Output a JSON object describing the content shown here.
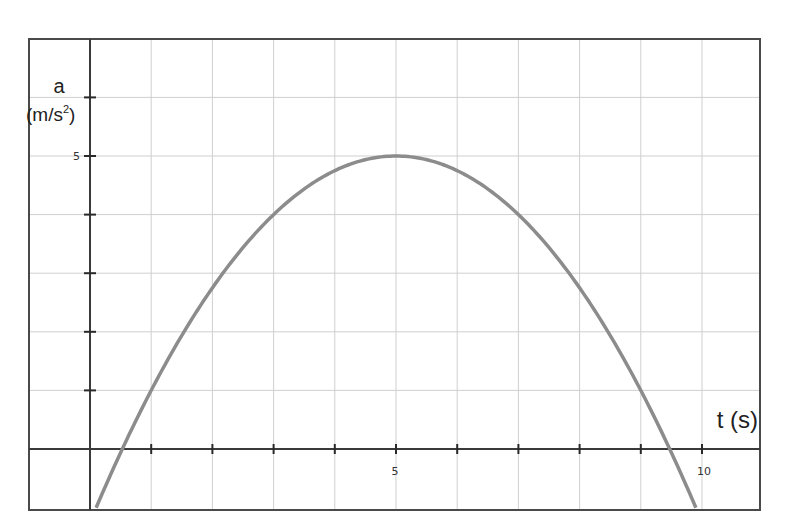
{
  "chart_data": {
    "type": "line",
    "title": "",
    "xlabel": "t (s)",
    "ylabel": "a",
    "ylabel_units": "(m/s",
    "ylabel_units_sup": "2",
    "ylabel_units_close": ")",
    "xlim": [
      -1.0,
      11.0
    ],
    "ylim": [
      -1.05,
      6.95
    ],
    "grid": true,
    "x_ticks": [
      1,
      2,
      3,
      4,
      5,
      6,
      7,
      8,
      9,
      10
    ],
    "x_tick_labels": [
      {
        "value": 5,
        "label": "5"
      },
      {
        "value": 10,
        "label": "10"
      }
    ],
    "y_ticks": [
      1,
      2,
      3,
      4,
      5,
      6
    ],
    "y_tick_labels": [
      {
        "value": 5,
        "label": "5"
      }
    ],
    "series": [
      {
        "name": "a(t)",
        "color": "#8c8c8c",
        "equation": "a = 5 - 0.25*(t-5)^2",
        "x": [
          0.1,
          0.53,
          1,
          2,
          3,
          4,
          5,
          6,
          7,
          8,
          9,
          9.47,
          9.9
        ],
        "y": [
          -1.0,
          0.0,
          1.0,
          2.75,
          4.0,
          4.75,
          5.0,
          4.75,
          4.0,
          2.75,
          1.0,
          0.0,
          -1.0
        ]
      }
    ],
    "annotations": []
  },
  "labels": {
    "x_axis": "t (s)",
    "y_axis_var": "a",
    "y_axis_units": "(m/s",
    "y_axis_sup": "2",
    "y_axis_close": ")",
    "y_tick_5": "5",
    "x_tick_5": "5",
    "x_tick_10": "10"
  }
}
